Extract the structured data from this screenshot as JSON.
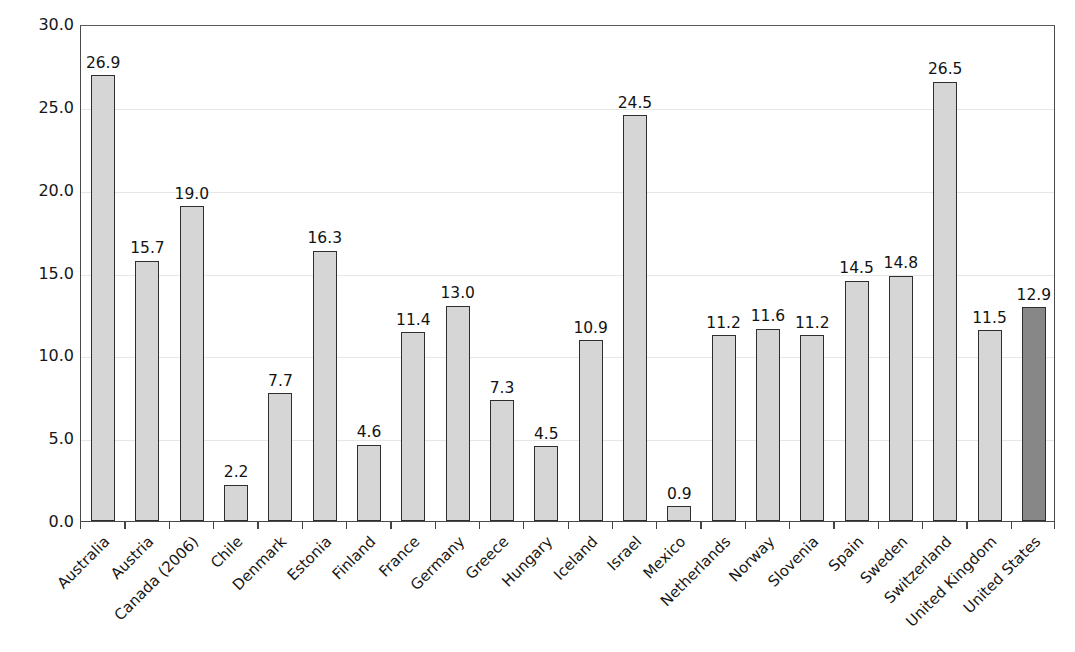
{
  "chart_data": {
    "type": "bar",
    "title": "",
    "xlabel": "",
    "ylabel": "Percent foreign born",
    "ylim": [
      0,
      30
    ],
    "ytick_step": 5,
    "ytick_labels": [
      "0.0",
      "5.0",
      "10.0",
      "15.0",
      "20.0",
      "25.0",
      "30.0"
    ],
    "ytick_values": [
      0,
      5,
      10,
      15,
      20,
      25,
      30
    ],
    "grid": true,
    "grid_axis": "y",
    "legend": "none",
    "value_labels": true,
    "value_label_format": "one-decimal",
    "categories": [
      "Australia",
      "Austria",
      "Canada (2006)",
      "Chile",
      "Denmark",
      "Estonia",
      "Finland",
      "France",
      "Germany",
      "Greece",
      "Hungary",
      "Iceland",
      "Israel",
      "Mexico",
      "Netherlands",
      "Norway",
      "Slovenia",
      "Spain",
      "Sweden",
      "Switzerland",
      "United Kingdom",
      "United States"
    ],
    "values": [
      26.9,
      15.7,
      19.0,
      2.2,
      7.7,
      16.3,
      4.6,
      11.4,
      13.0,
      7.3,
      4.5,
      10.9,
      24.5,
      0.9,
      11.2,
      11.6,
      11.2,
      14.5,
      14.8,
      26.5,
      11.5,
      12.9
    ],
    "value_labels_text": [
      "26.9",
      "15.7",
      "19.0",
      "2.2",
      "7.7",
      "16.3",
      "4.6",
      "11.4",
      "13.0",
      "7.3",
      "4.5",
      "10.9",
      "24.5",
      "0.9",
      "11.2",
      "11.6",
      "11.2",
      "14.5",
      "14.8",
      "26.5",
      "11.5",
      "12.9"
    ],
    "highlight_category": "United States",
    "colors": {
      "bar_fill": "#d6d6d6",
      "bar_highlight_fill": "#878787",
      "bar_edge": "#2e2e2e",
      "gridline": "#e6e6e6",
      "axis": "#4a4a4a",
      "text": "#171717",
      "background": "#ffffff"
    }
  }
}
